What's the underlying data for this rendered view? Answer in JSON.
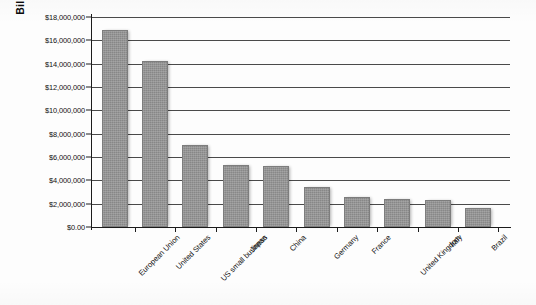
{
  "chart_data": {
    "type": "bar",
    "title": "",
    "xlabel": "",
    "ylabel": "Billions",
    "ylim": [
      0,
      18000000
    ],
    "ytick_step": 2000000,
    "ytick_labels": [
      "$18,000,000",
      "$16,000,000",
      "$14,000,000",
      "$12,000,000",
      "$10,000,000",
      "$8,000,000",
      "$6,000,000",
      "$4,000,000",
      "$2,000,000",
      "$0.00"
    ],
    "ytick_values": [
      18000000,
      16000000,
      14000000,
      12000000,
      10000000,
      8000000,
      6000000,
      4000000,
      2000000,
      0
    ],
    "grid": true,
    "legend": "none",
    "categories": [
      "European Union",
      "United States",
      "US small business",
      "Japan",
      "China",
      "Germany",
      "France",
      "United Kingdom",
      "Italy",
      "Brazil"
    ],
    "values": [
      16900000,
      14200000,
      7000000,
      5300000,
      5200000,
      3400000,
      2600000,
      2400000,
      2300000,
      1600000
    ],
    "series": [
      {
        "name": "GDP",
        "values": [
          16900000,
          14200000,
          7000000,
          5300000,
          5200000,
          3400000,
          2600000,
          2400000,
          2300000,
          1600000
        ]
      }
    ],
    "bar_color": "#919191",
    "bar_edge_color": "#7d7d7d",
    "axis_color": "#1c1c1c",
    "gridline_color": "#4a4a4a"
  }
}
